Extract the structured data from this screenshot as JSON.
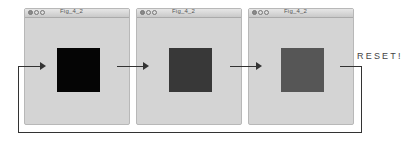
{
  "windows": [
    {
      "title": "Fig_4_2",
      "square_color": "#050505",
      "left": 24
    },
    {
      "title": "Fig_4_2",
      "square_color": "#383838",
      "left": 136
    },
    {
      "title": "Fig_4_2",
      "square_color": "#565656",
      "left": 248
    }
  ],
  "annotation": {
    "reset_label": "RESET!"
  },
  "colors": {
    "window_bg": "#d4d4d4",
    "line": "#333333"
  }
}
